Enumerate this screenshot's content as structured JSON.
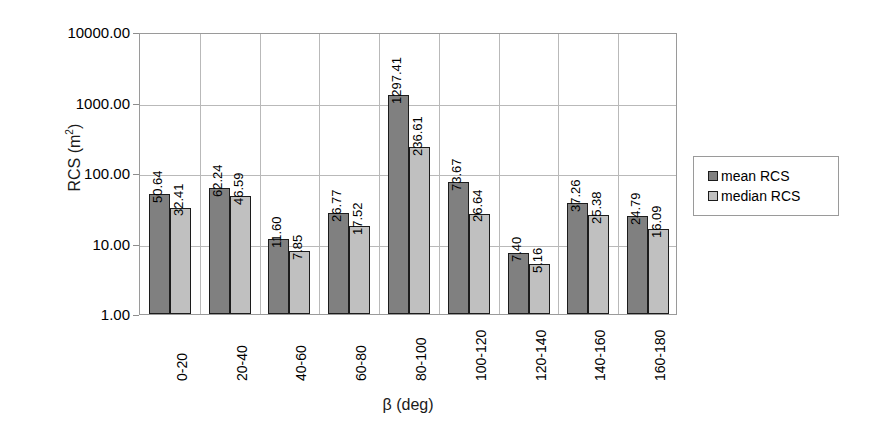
{
  "chart_data": {
    "type": "bar",
    "title": "",
    "xlabel": "β (deg)",
    "ylabel": "RCS (m²)",
    "ylabel_base": "RCS (m",
    "ylabel_exp": "2",
    "ylabel_close": ")",
    "yscale": "log",
    "ylim": [
      1,
      10000
    ],
    "ytick_labels": [
      "10000.00",
      "1000.00",
      "100.00",
      "10.00",
      "1.00"
    ],
    "ytick_values": [
      10000,
      1000,
      100,
      10,
      1
    ],
    "grid": true,
    "legend_position": "right",
    "categories": [
      "0-20",
      "20-40",
      "40-60",
      "60-80",
      "80-100",
      "100-120",
      "120-140",
      "140-160",
      "160-180"
    ],
    "series": [
      {
        "name": "mean RCS",
        "color": "#808080",
        "values": [
          50.64,
          62.24,
          11.6,
          26.77,
          1297.41,
          73.67,
          7.4,
          37.26,
          24.79
        ],
        "labels": [
          "50.64",
          "62.24",
          "11.60",
          "26.77",
          "1297.41",
          "73.67",
          "7.40",
          "37.26",
          "24.79"
        ]
      },
      {
        "name": "median RCS",
        "color": "#c0c0c0",
        "values": [
          32.41,
          46.59,
          7.85,
          17.52,
          236.61,
          26.64,
          5.16,
          25.38,
          16.09
        ],
        "labels": [
          "32.41",
          "46.59",
          "7.85",
          "17.52",
          "236.61",
          "26.64",
          "5.16",
          "25.38",
          "16.09"
        ]
      }
    ]
  },
  "legend": {
    "items": [
      {
        "label": "mean RCS",
        "swatch": "mean"
      },
      {
        "label": "median RCS",
        "swatch": "median"
      }
    ]
  }
}
